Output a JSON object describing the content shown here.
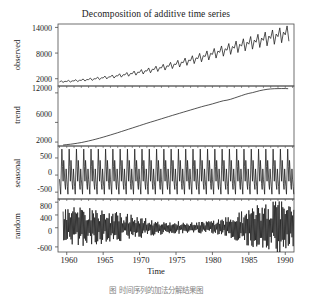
{
  "chart_data": {
    "type": "line",
    "title": "Decomposition of additive time series",
    "xlabel": "Time",
    "xlim": [
      1958.8,
      1991.2
    ],
    "xticks": [
      1960,
      1965,
      1970,
      1975,
      1980,
      1985,
      1990
    ],
    "xtick_labels": [
      "1960",
      "1965",
      "1970",
      "1975",
      "1980",
      "1985",
      "1990"
    ],
    "grid": false,
    "legend": "none",
    "line_color": "#1a1a1a",
    "axis_color": "#4d4d4d",
    "background": "#ffffff",
    "panels": [
      {
        "name": "observed",
        "ylabel": "observed",
        "ylim": [
          300,
          14800
        ],
        "yticks": [
          2000,
          8000,
          14000
        ],
        "ytick_labels": [
          "2000",
          "8000",
          "14000"
        ],
        "description": "Monthly series rising exponentially from about 1200 in 1959 to about 13000 in 1991, with a regular annual seasonal oscillation whose amplitude grows with the level.",
        "x": [
          1959.0,
          1959.25,
          1959.5,
          1959.75,
          1960.0,
          1960.25,
          1960.5,
          1960.75,
          1961.0,
          1961.25,
          1961.5,
          1961.75,
          1962.0,
          1962.25,
          1962.5,
          1962.75,
          1963.0,
          1963.25,
          1963.5,
          1963.75,
          1964.0,
          1964.25,
          1964.5,
          1964.75,
          1965.0,
          1965.25,
          1965.5,
          1965.75,
          1966.0,
          1966.25,
          1966.5,
          1966.75,
          1967.0,
          1967.25,
          1967.5,
          1967.75,
          1968.0,
          1968.25,
          1968.5,
          1968.75,
          1969.0,
          1969.25,
          1969.5,
          1969.75,
          1970.0,
          1970.25,
          1970.5,
          1970.75,
          1971.0,
          1971.25,
          1971.5,
          1971.75,
          1972.0,
          1972.25,
          1972.5,
          1972.75,
          1973.0,
          1973.25,
          1973.5,
          1973.75,
          1974.0,
          1974.25,
          1974.5,
          1974.75,
          1975.0,
          1975.25,
          1975.5,
          1975.75,
          1976.0,
          1976.25,
          1976.5,
          1976.75,
          1977.0,
          1977.25,
          1977.5,
          1977.75,
          1978.0,
          1978.25,
          1978.5,
          1978.75,
          1979.0,
          1979.25,
          1979.5,
          1979.75,
          1980.0,
          1980.25,
          1980.5,
          1980.75,
          1981.0,
          1981.25,
          1981.5,
          1981.75,
          1982.0,
          1982.25,
          1982.5,
          1982.75,
          1983.0,
          1983.25,
          1983.5,
          1983.75,
          1984.0,
          1984.25,
          1984.5,
          1984.75,
          1985.0,
          1985.25,
          1985.5,
          1985.75,
          1986.0,
          1986.25,
          1986.5,
          1986.75,
          1987.0,
          1987.25,
          1987.5,
          1987.75,
          1988.0,
          1988.25,
          1988.5,
          1988.75,
          1989.0,
          1989.25,
          1989.5,
          1989.75,
          1990.0,
          1990.25,
          1990.5,
          1990.75,
          1991.0
        ],
        "y": [
          1250,
          1500,
          1150,
          1400,
          1350,
          1620,
          1230,
          1500,
          1480,
          1780,
          1330,
          1640,
          1620,
          1950,
          1460,
          1800,
          1800,
          2150,
          1610,
          1990,
          1990,
          2380,
          1780,
          2200,
          2200,
          2620,
          1960,
          2430,
          2420,
          2880,
          2160,
          2680,
          2650,
          3160,
          2370,
          2940,
          2900,
          3450,
          2590,
          3220,
          3180,
          3790,
          2840,
          3530,
          3480,
          4140,
          3100,
          3860,
          3800,
          4520,
          3390,
          4220,
          4150,
          4930,
          3700,
          4600,
          4520,
          5370,
          4030,
          5010,
          4910,
          5830,
          4380,
          5440,
          5320,
          6310,
          4740,
          5890,
          5760,
          6830,
          5130,
          6370,
          6220,
          7370,
          5540,
          6880,
          6700,
          7930,
          5960,
          7400,
          7190,
          8500,
          6390,
          7930,
          7690,
          9080,
          6830,
          8470,
          8180,
          9660,
          7270,
          9010,
          8670,
          10230,
          7700,
          9540,
          9150,
          10800,
          8120,
          10060,
          9620,
          11340,
          8520,
          10550,
          10080,
          11870,
          8920,
          11040,
          10540,
          12390,
          9310,
          11520,
          10980,
          12900,
          9690,
          11990,
          11420,
          13400,
          10060,
          12450,
          11850,
          13890,
          10420,
          12900,
          12270,
          14350,
          10770
        ],
        "n_points": 129
      },
      {
        "name": "trend",
        "ylabel": "trend",
        "ylim": [
          1200,
          13400
        ],
        "yticks": [
          2000,
          6000,
          12000
        ],
        "ytick_labels": [
          "2000",
          "6000",
          "12000"
        ],
        "description": "Smooth centred moving-average trend increasing monotonically from about 1400 in 1959 to about 12800 in 1990.",
        "x": [
          1959.5,
          1960,
          1960.5,
          1961,
          1961.5,
          1962,
          1962.5,
          1963,
          1963.5,
          1964,
          1964.5,
          1965,
          1965.5,
          1966,
          1966.5,
          1967,
          1967.5,
          1968,
          1968.5,
          1969,
          1969.5,
          1970,
          1970.5,
          1971,
          1971.5,
          1972,
          1972.5,
          1973,
          1973.5,
          1974,
          1974.5,
          1975,
          1975.5,
          1976,
          1976.5,
          1977,
          1977.5,
          1978,
          1978.5,
          1979,
          1979.5,
          1980,
          1980.5,
          1981,
          1981.5,
          1982,
          1982.5,
          1983,
          1983.5,
          1984,
          1984.5,
          1985,
          1985.5,
          1986,
          1986.5,
          1987,
          1987.5,
          1988,
          1988.5,
          1989,
          1989.5,
          1990,
          1990.4
        ],
        "y": [
          1400,
          1480,
          1560,
          1660,
          1780,
          1900,
          2060,
          2220,
          2400,
          2590,
          2790,
          3000,
          3220,
          3440,
          3670,
          3900,
          4140,
          4380,
          4620,
          4860,
          5100,
          5340,
          5580,
          5820,
          6050,
          6270,
          6500,
          6730,
          6960,
          7190,
          7420,
          7640,
          7860,
          8080,
          8300,
          8520,
          8740,
          8960,
          9180,
          9380,
          9560,
          9760,
          9980,
          10200,
          10400,
          10520,
          10700,
          10950,
          11200,
          11450,
          11700,
          11900,
          12050,
          12250,
          12450,
          12600,
          12720,
          12800,
          12850,
          12870,
          12880,
          12880,
          12850
        ],
        "n_points": 63
      },
      {
        "name": "seasonal",
        "ylabel": "seasonal",
        "ylim": [
          -700,
          850
        ],
        "yticks": [
          -500,
          0,
          500
        ],
        "ytick_labels": [
          "-500",
          "0",
          "500"
        ],
        "description": "Fixed additive annual seasonal component repeating every 12 months with a sharp positive spike of about +750 and a sharp negative dip of about -560; constant amplitude across the whole record.",
        "period_months": 12,
        "seasonal_figure": [
          -120,
          -330,
          -560,
          120,
          760,
          250,
          -180,
          430,
          120,
          -250,
          -420,
          180
        ],
        "amplitude_max": 760,
        "amplitude_min": -560
      },
      {
        "name": "random",
        "ylabel": "random",
        "ylim": [
          -760,
          900
        ],
        "yticks": [
          -600,
          0,
          400,
          800
        ],
        "ytick_labels": [
          "-600",
          "0",
          "400",
          "800"
        ],
        "description": "Irregular remainder: large oscillations of roughly +/-600 during 1960-1968, a calmer band of roughly +/-200 between about 1972 and 1982, and renewed large swings after 1983 reaching about +800 and -700.",
        "envelope": [
          {
            "year": 1960,
            "amp": 620
          },
          {
            "year": 1964,
            "amp": 560
          },
          {
            "year": 1968,
            "amp": 400
          },
          {
            "year": 1972,
            "amp": 230
          },
          {
            "year": 1976,
            "amp": 180
          },
          {
            "year": 1980,
            "amp": 200
          },
          {
            "year": 1983,
            "amp": 380
          },
          {
            "year": 1986,
            "amp": 640
          },
          {
            "year": 1989,
            "amp": 780
          },
          {
            "year": 1990.5,
            "amp": 700
          }
        ]
      }
    ]
  },
  "caption": {
    "text": "图 时间序列的加法分解结果图"
  }
}
